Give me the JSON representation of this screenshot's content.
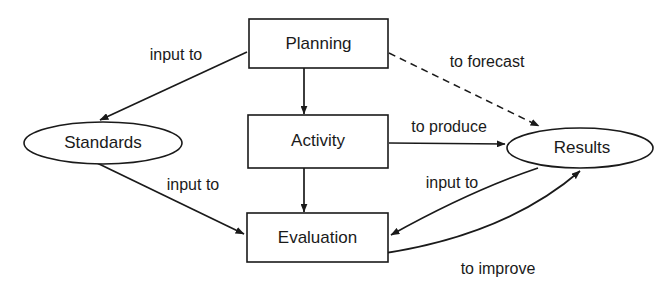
{
  "diagram": {
    "colors": {
      "stroke": "#1a1a1a",
      "fill": "#ffffff",
      "background": "#ffffff"
    },
    "nodes": [
      {
        "id": "planning",
        "label": "Planning",
        "shape": "rectangle",
        "x": 249,
        "y": 19,
        "w": 139,
        "h": 49
      },
      {
        "id": "activity",
        "label": "Activity",
        "shape": "rectangle",
        "x": 248,
        "y": 115,
        "w": 140,
        "h": 53
      },
      {
        "id": "evaluation",
        "label": "Evaluation",
        "shape": "rectangle",
        "x": 247,
        "y": 213,
        "w": 141,
        "h": 49
      },
      {
        "id": "standards",
        "label": "Standards",
        "shape": "ellipse",
        "cx": 103,
        "cy": 143,
        "rx": 79,
        "ry": 21
      },
      {
        "id": "results",
        "label": "Results",
        "shape": "ellipse",
        "cx": 580,
        "cy": 148,
        "rx": 73,
        "ry": 20
      }
    ],
    "edges": [
      {
        "id": "standards-to-planning",
        "from": "standards",
        "to": "planning",
        "label": "input to",
        "style": "solid",
        "label_x": 176,
        "label_y": 56
      },
      {
        "id": "planning-to-activity",
        "from": "planning",
        "to": "activity",
        "label": "",
        "style": "solid",
        "label_x": 0,
        "label_y": 0
      },
      {
        "id": "planning-to-results",
        "from": "planning",
        "to": "results",
        "label": "to forecast",
        "style": "dashed",
        "label_x": 487,
        "label_y": 63
      },
      {
        "id": "activity-to-results",
        "from": "activity",
        "to": "results",
        "label": "to produce",
        "style": "solid",
        "label_x": 449,
        "label_y": 128
      },
      {
        "id": "activity-to-evaluation",
        "from": "activity",
        "to": "evaluation",
        "label": "",
        "style": "solid",
        "label_x": 0,
        "label_y": 0
      },
      {
        "id": "standards-to-evaluation",
        "from": "standards",
        "to": "evaluation",
        "label": "input to",
        "style": "solid",
        "label_x": 193,
        "label_y": 186
      },
      {
        "id": "results-to-evaluation",
        "from": "results",
        "to": "evaluation",
        "label": "input to",
        "style": "solid",
        "label_x": 452,
        "label_y": 184
      },
      {
        "id": "evaluation-to-results",
        "from": "evaluation",
        "to": "results",
        "label": "to improve",
        "style": "solid",
        "label_x": 498,
        "label_y": 270
      }
    ]
  }
}
